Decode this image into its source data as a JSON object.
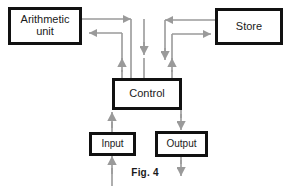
{
  "figure": {
    "caption": "Fig. 4",
    "colors": {
      "box_border": "#111111",
      "box_fill": "#ffffff",
      "wire": "#9a9a9a",
      "text": "#1a1a1a",
      "background": "#ffffff"
    }
  },
  "nodes": [
    {
      "id": "arithmetic",
      "label": "Arithmetic\nunit",
      "x": 8,
      "y": 7,
      "w": 74,
      "h": 38
    },
    {
      "id": "store",
      "label": "Store",
      "x": 215,
      "y": 8,
      "w": 68,
      "h": 37
    },
    {
      "id": "control",
      "label": "Control",
      "x": 112,
      "y": 78,
      "w": 70,
      "h": 32
    },
    {
      "id": "input",
      "label": "Input",
      "x": 89,
      "y": 132,
      "w": 47,
      "h": 24
    },
    {
      "id": "output",
      "label": "Output",
      "x": 155,
      "y": 131,
      "w": 53,
      "h": 26
    }
  ],
  "connections": [
    {
      "id": "arith-to-store-top",
      "from": "arithmetic",
      "to": "store",
      "direction": "right"
    },
    {
      "id": "store-to-arith",
      "from": "store",
      "to": "arithmetic",
      "direction": "left"
    },
    {
      "id": "control-to-arith",
      "from": "control",
      "to": "arithmetic",
      "direction": "up-left"
    },
    {
      "id": "arith-to-control",
      "from": "arithmetic",
      "to": "control",
      "direction": "down"
    },
    {
      "id": "store-to-control",
      "from": "store",
      "to": "control",
      "direction": "down"
    },
    {
      "id": "control-to-store",
      "from": "control",
      "to": "store",
      "direction": "up-right"
    },
    {
      "id": "input-to-control",
      "from": "input",
      "to": "control",
      "direction": "up"
    },
    {
      "id": "control-to-output",
      "from": "control",
      "to": "output",
      "direction": "down"
    },
    {
      "id": "external-to-input",
      "from": "external",
      "to": "input",
      "direction": "up"
    },
    {
      "id": "output-to-external",
      "from": "output",
      "to": "external",
      "direction": "down"
    }
  ]
}
